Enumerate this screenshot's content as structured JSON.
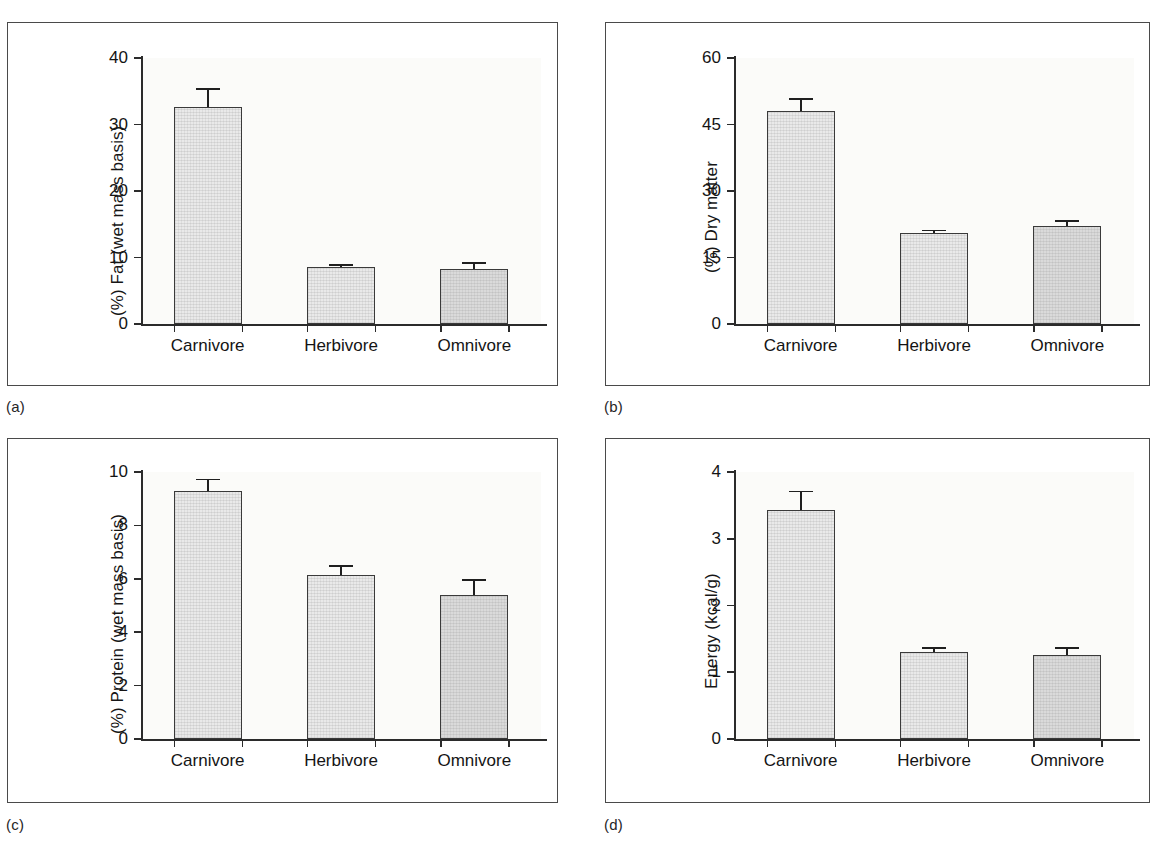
{
  "figure": {
    "categories": [
      "Carnivore",
      "Herbivore",
      "Omnivore"
    ],
    "panels": [
      {
        "id": "a",
        "caption": "(a)",
        "ylabel": "(%) Fat (wet mass basis)",
        "yticks": [
          "0",
          "10",
          "20",
          "30",
          "40"
        ]
      },
      {
        "id": "b",
        "caption": "(b)",
        "ylabel": "(%) Dry matter",
        "yticks": [
          "0",
          "15",
          "30",
          "45",
          "60"
        ]
      },
      {
        "id": "c",
        "caption": "(c)",
        "ylabel": "(%) Protein (wet mass basis)",
        "yticks": [
          "0",
          "2",
          "4",
          "6",
          "8",
          "10"
        ]
      },
      {
        "id": "d",
        "caption": "(d)",
        "ylabel": "Energy (kcal/g)",
        "yticks": [
          "0",
          "1",
          "2",
          "3",
          "4"
        ]
      }
    ],
    "colors": {
      "bar_light": "#e9e9e9",
      "bar_dark": "#dadada",
      "bar_outline": "#3a3a3a",
      "axis": "#2b2b2b",
      "frame": "#4a4a4a",
      "plot_background": "#fbfbf9",
      "text": "#141414"
    }
  },
  "chart_data": [
    {
      "type": "bar",
      "panel": "a",
      "title": "",
      "xlabel": "",
      "ylabel": "(%) Fat (wet mass basis)",
      "categories": [
        "Carnivore",
        "Herbivore",
        "Omnivore"
      ],
      "values": [
        32.7,
        8.5,
        8.2
      ],
      "errors": [
        2.8,
        0.5,
        1.1
      ],
      "ylim": [
        0,
        40
      ],
      "yticks": [
        0,
        10,
        20,
        30,
        40
      ],
      "grid": false,
      "legend": "none"
    },
    {
      "type": "bar",
      "panel": "b",
      "title": "",
      "xlabel": "",
      "ylabel": "(%) Dry matter",
      "categories": [
        "Carnivore",
        "Herbivore",
        "Omnivore"
      ],
      "values": [
        48.0,
        20.5,
        22.0
      ],
      "errors": [
        3.0,
        0.8,
        1.4
      ],
      "ylim": [
        0,
        60
      ],
      "yticks": [
        0,
        15,
        30,
        45,
        60
      ],
      "grid": false,
      "legend": "none"
    },
    {
      "type": "bar",
      "panel": "c",
      "title": "",
      "xlabel": "",
      "ylabel": "(%) Protein (wet mass basis)",
      "categories": [
        "Carnivore",
        "Herbivore",
        "Omnivore"
      ],
      "values": [
        9.3,
        6.15,
        5.4
      ],
      "errors": [
        0.45,
        0.35,
        0.6
      ],
      "ylim": [
        0,
        10
      ],
      "yticks": [
        0,
        2,
        4,
        6,
        8,
        10
      ],
      "grid": false,
      "legend": "none"
    },
    {
      "type": "bar",
      "panel": "d",
      "title": "",
      "xlabel": "",
      "ylabel": "Energy (kcal/g)",
      "categories": [
        "Carnivore",
        "Herbivore",
        "Omnivore"
      ],
      "values": [
        3.43,
        1.3,
        1.26
      ],
      "errors": [
        0.29,
        0.08,
        0.12
      ],
      "ylim": [
        0,
        4
      ],
      "yticks": [
        0,
        1,
        2,
        3,
        4
      ],
      "grid": false,
      "legend": "none"
    }
  ]
}
